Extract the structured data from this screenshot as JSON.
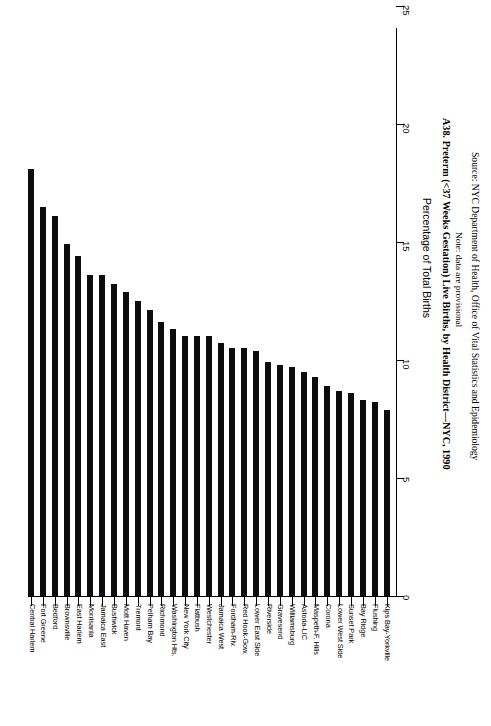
{
  "chart_data": {
    "type": "bar",
    "title": "A38. Preterm (<37 Weeks Gestation) Live Births, by Health District—NYC, 1990",
    "note": "Note: data are provisional",
    "source": "Source: NYC Department of Health, Office of Vital Statistics and Epidemiology",
    "xlabel": "",
    "ylabel": "Percentage of Total Births",
    "ylim": [
      0,
      25
    ],
    "yticks": [
      0,
      5,
      10,
      15,
      20,
      25
    ],
    "ytick_labels": [
      "0",
      "5",
      "10",
      "15",
      "20",
      "25"
    ],
    "grid": false,
    "legend": null,
    "orientation": "vertical-bars-rotated-page",
    "bar_color": "#0d0d0d",
    "categories": [
      "Central Harlem",
      "Fort Greene",
      "Bedford",
      "Brownsville",
      "East Harlem",
      "Morrisania",
      "Jamaica East",
      "Bushwick",
      "Mott Haven",
      "Tremont",
      "Pelham Bay",
      "Richmond",
      "Washington Hts.",
      "New York City",
      "Flatbush",
      "Westchester",
      "Jamaica West",
      "Fordham-Riv.",
      "Red Hook-Gow.",
      "Lower East Side",
      "Riverside",
      "Gravesend",
      "Williamsburg",
      "Astoria-LIC",
      "Maspeth-F. Hills",
      "Corona",
      "Lower West Side",
      "Sunset Park",
      "Bay Ridge",
      "Flushing",
      "Kips Bay-Yorkville"
    ],
    "values": [
      18.1,
      16.5,
      16.1,
      14.9,
      14.4,
      13.6,
      13.6,
      13.2,
      12.9,
      12.5,
      12.1,
      11.6,
      11.3,
      11.0,
      11.0,
      11.0,
      10.7,
      10.5,
      10.5,
      10.4,
      9.9,
      9.8,
      9.7,
      9.5,
      9.3,
      8.9,
      8.7,
      8.6,
      8.3,
      8.2,
      7.9
    ]
  }
}
